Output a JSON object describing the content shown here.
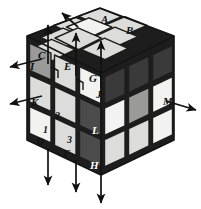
{
  "figure": {
    "kind": "rubiks-cube-isometric-diagram",
    "width": 201,
    "height": 209,
    "background": "#ffffff"
  },
  "palette": {
    "white": "#f2f2f0",
    "light": "#dcdcda",
    "mid": "#9a9a98",
    "dark": "#4b4b4b",
    "darker": "#3a3a3a",
    "gap": "#1d1d1d",
    "outline": "#141414",
    "arrow": "#111111",
    "label": "#111111",
    "label_light": "#ffffff"
  },
  "labels": [
    {
      "id": "A",
      "text": "A",
      "x": 101,
      "y": 14,
      "tone": "dark"
    },
    {
      "id": "B",
      "text": "B",
      "x": 126,
      "y": 25,
      "tone": "dark"
    },
    {
      "id": "C",
      "text": "C",
      "x": 38,
      "y": 50,
      "tone": "dark"
    },
    {
      "id": "I",
      "text": "I",
      "x": 29,
      "y": 61,
      "tone": "dark"
    },
    {
      "id": "E",
      "text": "E",
      "x": 64,
      "y": 61,
      "tone": "dark"
    },
    {
      "id": "G",
      "text": "G",
      "x": 89,
      "y": 73,
      "tone": "dark"
    },
    {
      "id": "J",
      "text": "J",
      "x": 95,
      "y": 89,
      "tone": "dark"
    },
    {
      "id": "K",
      "text": "K",
      "x": 30,
      "y": 97,
      "tone": "dark"
    },
    {
      "id": "M",
      "text": "M",
      "x": 164,
      "y": 96,
      "tone": "dark"
    },
    {
      "id": "2",
      "text": "2",
      "x": 55,
      "y": 110,
      "tone": "dark"
    },
    {
      "id": "1",
      "text": "1",
      "x": 43,
      "y": 124,
      "tone": "dark"
    },
    {
      "id": "L",
      "text": "L",
      "x": 92,
      "y": 125,
      "tone": "light"
    },
    {
      "id": "D",
      "text": "D",
      "x": 36,
      "y": 136,
      "tone": "dark"
    },
    {
      "id": "3",
      "text": "3",
      "x": 67,
      "y": 134,
      "tone": "dark"
    },
    {
      "id": "F",
      "text": "F",
      "x": 63,
      "y": 148,
      "tone": "dark"
    },
    {
      "id": "H",
      "text": "H",
      "x": 90,
      "y": 160,
      "tone": "light"
    }
  ],
  "arrows": [
    {
      "id": "top-left-diagonal",
      "from": [
        76,
        25
      ],
      "to": [
        61,
        12
      ],
      "dir": "up-left"
    },
    {
      "id": "top-col-1-up",
      "from": [
        48,
        62
      ],
      "to": [
        48,
        25
      ],
      "dir": "up"
    },
    {
      "id": "top-col-2-up",
      "from": [
        76,
        68
      ],
      "to": [
        76,
        33
      ],
      "dir": "up"
    },
    {
      "id": "top-col-3-up",
      "from": [
        101,
        75
      ],
      "to": [
        101,
        40
      ],
      "dir": "up"
    },
    {
      "id": "left-row-1-out",
      "from": [
        40,
        58
      ],
      "to": [
        9,
        67
      ],
      "dir": "down-left"
    },
    {
      "id": "left-row-2-out",
      "from": [
        40,
        95
      ],
      "to": [
        9,
        104
      ],
      "dir": "down-left"
    },
    {
      "id": "right-row-2-out",
      "from": [
        172,
        103
      ],
      "to": [
        196,
        112
      ],
      "dir": "down-right"
    },
    {
      "id": "bottom-col-1-down",
      "from": [
        48,
        150
      ],
      "to": [
        48,
        186
      ],
      "dir": "down"
    },
    {
      "id": "bottom-col-2-down",
      "from": [
        76,
        157
      ],
      "to": [
        76,
        193
      ],
      "dir": "down"
    },
    {
      "id": "bottom-col-3-down",
      "from": [
        101,
        165
      ],
      "to": [
        101,
        201
      ],
      "dir": "down"
    }
  ],
  "right_angle_marks": [
    {
      "id": "mark-E-corner",
      "x": 52,
      "y": 72
    },
    {
      "id": "mark-G-corner",
      "x": 77,
      "y": 84
    }
  ],
  "faces": {
    "top": {
      "name": "top-face",
      "tiles": [
        {
          "r": 0,
          "c": 0,
          "shade": "light"
        },
        {
          "r": 0,
          "c": 1,
          "shade": "light"
        },
        {
          "r": 0,
          "c": 2,
          "shade": "light"
        },
        {
          "r": 1,
          "c": 0,
          "shade": "light"
        },
        {
          "r": 1,
          "c": 1,
          "shade": "white"
        },
        {
          "r": 1,
          "c": 2,
          "shade": "light"
        },
        {
          "r": 2,
          "c": 0,
          "shade": "light"
        },
        {
          "r": 2,
          "c": 1,
          "shade": "light"
        },
        {
          "r": 2,
          "c": 2,
          "shade": "light"
        }
      ]
    },
    "left": {
      "name": "left-face",
      "tiles": [
        {
          "r": 0,
          "c": 0,
          "shade": "mid"
        },
        {
          "r": 0,
          "c": 1,
          "shade": "light"
        },
        {
          "r": 1,
          "c": 0,
          "shade": "light"
        },
        {
          "r": 1,
          "c": 1,
          "shade": "light"
        },
        {
          "r": 2,
          "c": 0,
          "shade": "white"
        },
        {
          "r": 2,
          "c": 1,
          "shade": "light"
        }
      ]
    },
    "front": {
      "name": "front-face",
      "tiles": [
        {
          "r": 0,
          "c": 0,
          "shade": "white"
        },
        {
          "r": 0,
          "c": 1,
          "shade": "dark"
        },
        {
          "r": 1,
          "c": 0,
          "shade": "dark"
        },
        {
          "r": 1,
          "c": 1,
          "shade": "white"
        },
        {
          "r": 2,
          "c": 0,
          "shade": "dark"
        },
        {
          "r": 2,
          "c": 1,
          "shade": "light"
        }
      ]
    },
    "right": {
      "name": "right-face",
      "tiles": [
        {
          "r": 0,
          "c": 0,
          "shade": "darker"
        },
        {
          "r": 0,
          "c": 1,
          "shade": "darker"
        },
        {
          "r": 1,
          "c": 0,
          "shade": "mid"
        },
        {
          "r": 1,
          "c": 1,
          "shade": "white"
        },
        {
          "r": 2,
          "c": 0,
          "shade": "light"
        },
        {
          "r": 2,
          "c": 1,
          "shade": "white"
        }
      ]
    }
  }
}
